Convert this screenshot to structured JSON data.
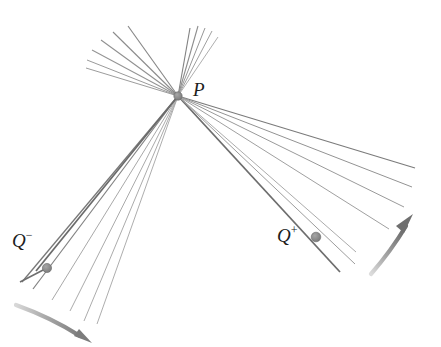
{
  "figure": {
    "background_color": "#ffffff",
    "width": 441,
    "height": 347,
    "labels": {
      "p": {
        "base": "P",
        "sup": ""
      },
      "q_minus": {
        "base": "Q",
        "sup": "−"
      },
      "q_plus": {
        "base": "Q",
        "sup": "+"
      }
    },
    "colors": {
      "line_light": "#a8a8a8",
      "line_mid": "#8c8c8c",
      "line_dark": "#6e6e6e",
      "line_darkest": "#5a5a5a",
      "node": "#8f8f8f",
      "node_stroke": "#6a6a6a",
      "arrow": "#909090",
      "text": "#1d1d1d"
    },
    "nodes": [
      {
        "name": "point-p",
        "label": "P",
        "x": 178,
        "y": 96,
        "radius": 4.2,
        "kind": "focal-vertex"
      },
      {
        "name": "point-q-minus",
        "label": "Q−",
        "x": 47,
        "y": 268,
        "radius": 4.6,
        "kind": "marked-point"
      },
      {
        "name": "point-q-plus",
        "label": "Q+",
        "x": 316,
        "y": 237,
        "radius": 4.8,
        "kind": "marked-point"
      }
    ],
    "fans": [
      {
        "name": "upper-left-fan",
        "origin": [
          178,
          96
        ],
        "count": 6,
        "endpoints": [
          [
            86,
            68
          ],
          [
            87,
            60
          ],
          [
            92,
            50
          ],
          [
            101,
            40
          ],
          [
            113,
            32
          ],
          [
            128,
            26
          ]
        ],
        "weights": [
          1.0,
          1.0,
          1.0,
          1.0,
          1.1,
          1.2
        ],
        "shades": [
          "#9c9c9c",
          "#9c9c9c",
          "#989898",
          "#949494",
          "#8e8e8e",
          "#8a8a8a"
        ]
      },
      {
        "name": "upper-right-fan",
        "origin": [
          178,
          96
        ],
        "count": 5,
        "endpoints": [
          [
            192,
            27
          ],
          [
            199,
            26
          ],
          [
            206,
            28
          ],
          [
            213,
            31
          ],
          [
            218,
            36
          ]
        ],
        "weights": [
          1.1,
          1.05,
          1.0,
          1.0,
          0.95
        ],
        "shades": [
          "#8a8a8a",
          "#909090",
          "#989898",
          "#a0a0a0",
          "#a8a8a8"
        ]
      },
      {
        "name": "lower-left-fan",
        "origin": [
          178,
          96
        ],
        "count": 7,
        "endpoints": [
          [
            22,
            282
          ],
          [
            33,
            289
          ],
          [
            52,
            300
          ],
          [
            70,
            311
          ],
          [
            84,
            321
          ],
          [
            96,
            324
          ],
          [
            40,
            272
          ]
        ],
        "weights": [
          1.35,
          1.25,
          0.95,
          0.95,
          0.95,
          0.95,
          1.45
        ],
        "shades": [
          "#767676",
          "#7e7e7e",
          "#a2a2a2",
          "#a4a4a4",
          "#a6a6a6",
          "#a8a8a8",
          "#6c6c6c"
        ]
      },
      {
        "name": "lower-right-fan",
        "origin": [
          178,
          96
        ],
        "count": 6,
        "endpoints": [
          [
            415,
            168
          ],
          [
            412,
            186
          ],
          [
            405,
            206
          ],
          [
            390,
            228
          ],
          [
            355,
            251
          ],
          [
            340,
            272
          ]
        ],
        "weights": [
          1.15,
          1.0,
          1.0,
          1.0,
          0.95,
          1.35
        ],
        "shades": [
          "#7c7c7c",
          "#949494",
          "#9a9a9a",
          "#a0a0a0",
          "#a6a6a6",
          "#6e6e6e"
        ]
      }
    ],
    "arrows": [
      {
        "name": "arrow-bottom-left",
        "direction": "right-down",
        "path": "M 18 306 Q 55 320 82 337",
        "head": [
          88,
          341
        ]
      },
      {
        "name": "arrow-right",
        "direction": "up-right",
        "path": "M 372 272 Q 392 250 409 222",
        "head": [
          412,
          216
        ]
      }
    ]
  }
}
